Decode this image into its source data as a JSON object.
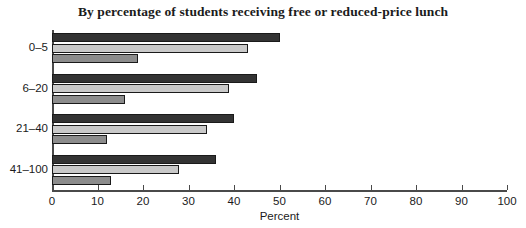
{
  "chart_data": {
    "type": "bar",
    "orientation": "horizontal",
    "title": "By percentage of students receiving free or reduced-price lunch",
    "xlabel": "Percent",
    "ylabel": "",
    "categories": [
      "0–5",
      "6–20",
      "21–40",
      "41–100"
    ],
    "xlim": [
      0,
      100
    ],
    "xticks": [
      0,
      10,
      20,
      30,
      40,
      50,
      60,
      70,
      80,
      90,
      100
    ],
    "xticklabels": [
      "0",
      "10",
      "20",
      "30",
      "40",
      "50",
      "60",
      "70",
      "80",
      "90",
      "100"
    ],
    "grid": false,
    "legend": "none",
    "series": [
      {
        "name": "series-1",
        "color": "#333333",
        "values": [
          50,
          45,
          40,
          36
        ]
      },
      {
        "name": "series-2",
        "color": "#c9c9c9",
        "values": [
          43,
          39,
          34,
          28
        ]
      },
      {
        "name": "series-3",
        "color": "#8c8c8c",
        "values": [
          19,
          16,
          12,
          13
        ]
      }
    ]
  },
  "colors": {
    "axis": "#4a4a4a",
    "text": "#1b1b1b",
    "background": "#ffffff",
    "bar_dark": "#333333",
    "bar_light": "#c9c9c9",
    "bar_medium": "#8c8c8c"
  }
}
